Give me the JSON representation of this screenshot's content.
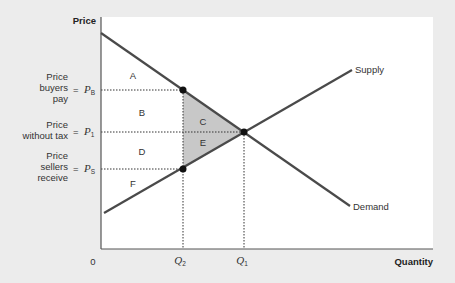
{
  "diagram": {
    "type": "supply-demand-tax-incidence",
    "axis": {
      "y_label": "Price",
      "x_label": "Quantity",
      "origin": "0"
    },
    "curves": {
      "supply": "Supply",
      "demand": "Demand"
    },
    "price_levels": [
      {
        "desc_lines": [
          "Price",
          "buyers",
          "pay"
        ],
        "symbol": "P",
        "sub": "B"
      },
      {
        "desc_lines": [
          "Price",
          "without tax"
        ],
        "symbol": "P",
        "sub": "1"
      },
      {
        "desc_lines": [
          "Price",
          "sellers",
          "receive"
        ],
        "symbol": "P",
        "sub": "S"
      }
    ],
    "quantities": [
      {
        "symbol": "Q",
        "sub": "2"
      },
      {
        "symbol": "Q",
        "sub": "1"
      }
    ],
    "equals": "=",
    "regions": [
      "A",
      "B",
      "C",
      "D",
      "E",
      "F"
    ],
    "colors": {
      "background": "#ececec",
      "plot": "#ffffff",
      "curve": "#4a4a4a",
      "deadweight": "#c8c8c8",
      "axis": "#555555"
    }
  }
}
